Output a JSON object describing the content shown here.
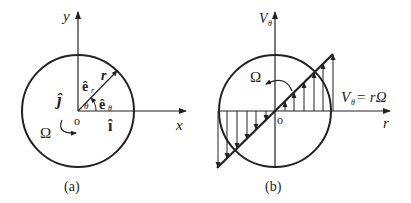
{
  "panel_a": {
    "caption": "(a)",
    "axis_y": "y",
    "axis_x": "x",
    "origin": "o",
    "radius_label": "r",
    "e_r": "ê",
    "e_r_sub": "r",
    "e_theta": "ê",
    "e_theta_sub": "θ",
    "theta": "θ",
    "i_hat": "î",
    "j_hat": "ĵ",
    "omega": "Ω"
  },
  "panel_b": {
    "caption": "(b)",
    "axis_v": "V",
    "axis_v_sub": "θ",
    "axis_r": "r",
    "origin": "o",
    "omega": "Ω",
    "formula_v": "V",
    "formula_sub": "θ",
    "formula_rhs": "= rΩ"
  },
  "colors": {
    "ink": "#222222",
    "background": "#ffffff"
  }
}
